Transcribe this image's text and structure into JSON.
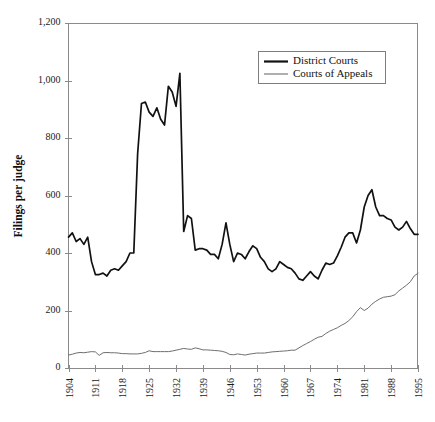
{
  "chart_data": {
    "type": "line",
    "title": "",
    "xlabel": "",
    "ylabel": "Filings per judge",
    "xlim": [
      1904,
      1995
    ],
    "ylim": [
      0,
      1200
    ],
    "grid": false,
    "legend_position": "top-right",
    "y_ticks": [
      0,
      200,
      400,
      600,
      800,
      1000,
      1200
    ],
    "y_tick_labels": [
      "0",
      "200",
      "400",
      "600",
      "800",
      "1,000",
      "1,200"
    ],
    "x_ticks": [
      1904,
      1911,
      1918,
      1925,
      1932,
      1939,
      1946,
      1953,
      1960,
      1967,
      1974,
      1981,
      1988,
      1995
    ],
    "x_tick_labels": [
      "1904",
      "1911",
      "1918",
      "1925",
      "1932",
      "1939",
      "1946",
      "1953",
      "1960",
      "1967",
      "1974",
      "1981",
      "1988",
      "1995"
    ],
    "x": [
      1904,
      1905,
      1906,
      1907,
      1908,
      1909,
      1910,
      1911,
      1912,
      1913,
      1914,
      1915,
      1916,
      1917,
      1918,
      1919,
      1920,
      1921,
      1922,
      1923,
      1924,
      1925,
      1926,
      1927,
      1928,
      1929,
      1930,
      1931,
      1932,
      1933,
      1934,
      1935,
      1936,
      1937,
      1938,
      1939,
      1940,
      1941,
      1942,
      1943,
      1944,
      1945,
      1946,
      1947,
      1948,
      1949,
      1950,
      1951,
      1952,
      1953,
      1954,
      1955,
      1956,
      1957,
      1958,
      1959,
      1960,
      1961,
      1962,
      1963,
      1964,
      1965,
      1966,
      1967,
      1968,
      1969,
      1970,
      1971,
      1972,
      1973,
      1974,
      1975,
      1976,
      1977,
      1978,
      1979,
      1980,
      1981,
      1982,
      1983,
      1984,
      1985,
      1986,
      1987,
      1988,
      1989,
      1990,
      1991,
      1992,
      1993,
      1994,
      1995
    ],
    "series": [
      {
        "name": "District Courts",
        "color": "#111111",
        "line_width": "thick",
        "values": [
          455,
          470,
          440,
          450,
          430,
          455,
          370,
          325,
          325,
          330,
          320,
          340,
          345,
          340,
          355,
          370,
          400,
          400,
          745,
          920,
          925,
          890,
          875,
          905,
          865,
          845,
          980,
          960,
          910,
          1025,
          475,
          530,
          520,
          410,
          415,
          415,
          410,
          395,
          395,
          380,
          430,
          505,
          430,
          370,
          400,
          395,
          380,
          405,
          425,
          415,
          385,
          370,
          345,
          335,
          345,
          370,
          360,
          350,
          345,
          330,
          310,
          305,
          320,
          335,
          320,
          310,
          340,
          365,
          360,
          365,
          390,
          420,
          455,
          470,
          470,
          435,
          480,
          560,
          600,
          620,
          560,
          530,
          530,
          520,
          515,
          490,
          480,
          490,
          510,
          485,
          465,
          465
        ]
      },
      {
        "name": "Courts of Appeals",
        "color": "#6e6e6e",
        "line_width": "thin",
        "values": [
          45,
          48,
          52,
          54,
          53,
          55,
          57,
          56,
          44,
          53,
          54,
          53,
          53,
          52,
          50,
          50,
          49,
          49,
          49,
          51,
          54,
          60,
          57,
          57,
          57,
          57,
          57,
          59,
          62,
          65,
          68,
          66,
          65,
          70,
          67,
          63,
          63,
          62,
          61,
          60,
          58,
          54,
          47,
          46,
          49,
          47,
          45,
          48,
          50,
          52,
          52,
          52,
          54,
          56,
          57,
          58,
          59,
          60,
          62,
          62,
          70,
          78,
          85,
          92,
          100,
          107,
          110,
          120,
          128,
          134,
          140,
          148,
          155,
          165,
          178,
          196,
          210,
          200,
          208,
          222,
          232,
          240,
          246,
          248,
          250,
          255,
          268,
          278,
          288,
          300,
          320,
          330
        ]
      }
    ],
    "legend": [
      {
        "label": "District Courts",
        "series": "district"
      },
      {
        "label": "Courts of Appeals",
        "series": "appeals"
      }
    ]
  }
}
